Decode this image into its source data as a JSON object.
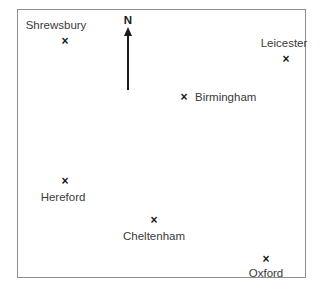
{
  "figure": {
    "type": "locator-map",
    "title": "",
    "background_color": "#ffffff",
    "frame": {
      "border_color": "#8d8d8d",
      "x": 17,
      "y": 9,
      "width": 289,
      "height": 269
    }
  },
  "north_arrow": {
    "label": "N",
    "label_x": 127,
    "label_y": 25,
    "tip_x": 127,
    "tip_y": 26,
    "tail_y": 89,
    "color": "#1a1a1a"
  },
  "marker": {
    "glyph": "×",
    "color": "#1a1a1a"
  },
  "cities": [
    {
      "name": "Shrewsbury",
      "marker_x": 64,
      "marker_y": 40,
      "label_x": 55,
      "label_y": 30,
      "label_position": "above"
    },
    {
      "name": "Leicester",
      "marker_x": 285,
      "marker_y": 58,
      "label_x": 283,
      "label_y": 48,
      "label_position": "above"
    },
    {
      "name": "Birmingham",
      "marker_x": 183,
      "marker_y": 96,
      "label_x": 194,
      "label_y": 96,
      "label_position": "right"
    },
    {
      "name": "Hereford",
      "marker_x": 64,
      "marker_y": 180,
      "label_x": 62,
      "label_y": 190,
      "label_position": "below"
    },
    {
      "name": "Cheltenham",
      "marker_x": 153,
      "marker_y": 219,
      "label_x": 153,
      "label_y": 229,
      "label_position": "below"
    },
    {
      "name": "Oxford",
      "marker_x": 265,
      "marker_y": 258,
      "label_x": 265,
      "label_y": 266,
      "label_position": "below"
    }
  ]
}
